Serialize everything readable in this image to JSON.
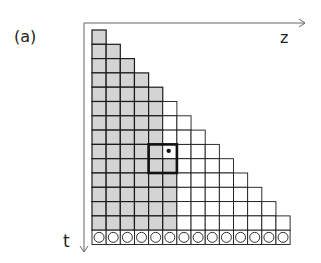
{
  "panel_label": "(a)",
  "axes": {
    "horizontal": {
      "label": "z",
      "direction": "right"
    },
    "vertical": {
      "label": "t",
      "direction": "down"
    }
  },
  "grid": {
    "columns": 14,
    "triangle_rows": 14,
    "row_rule": "row i (from top, 0-indexed) contains i+1 cells",
    "bottom_row": {
      "cells": 14,
      "marker": "circle"
    },
    "shading": {
      "color": "#d4d4d4",
      "rule": "rows 0-3 fully shaded; rows 4-8 shaded in columns 0-4; rows 9-13 shaded in columns 0-5",
      "shaded_columns_by_row": [
        1,
        2,
        3,
        4,
        5,
        5,
        5,
        5,
        5,
        6,
        6,
        6,
        6,
        6
      ]
    },
    "highlight_box": {
      "rows": [
        8,
        9
      ],
      "columns": [
        4,
        5
      ],
      "style": "thick border"
    },
    "marked_cell": {
      "row": 8,
      "column": 5,
      "label": "a"
    }
  },
  "colors": {
    "line": "#1a1a1a",
    "shade": "#d4d4d4",
    "axis": "#555555"
  }
}
